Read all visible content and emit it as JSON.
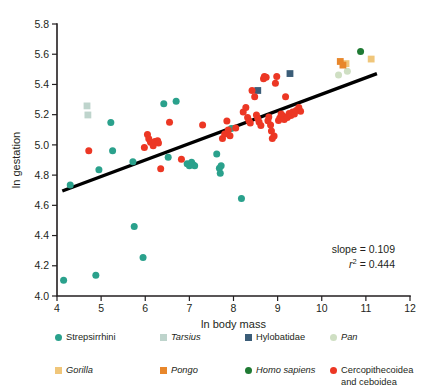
{
  "chart_data": {
    "type": "scatter",
    "title": "",
    "xlabel": "ln body mass",
    "ylabel": "ln gestation",
    "xlim": [
      4,
      12
    ],
    "ylim": [
      4.0,
      5.8
    ],
    "xticks": [
      "4",
      "5",
      "6",
      "7",
      "8",
      "9",
      "10",
      "11",
      "12"
    ],
    "yticks": [
      "4.0",
      "4.2",
      "4.4",
      "4.6",
      "4.8",
      "5.0",
      "5.2",
      "5.4",
      "5.6",
      "5.8"
    ],
    "grid": false,
    "legend_position": "below",
    "annotations": {
      "slope_label": "slope = 0.109",
      "r2_prefix": "r",
      "r2_sup": "2",
      "r2_value": " = 0.444"
    },
    "trendline": {
      "name": "least-squares fit",
      "slope": 0.109,
      "r_squared": 0.444,
      "x0": 4.12,
      "y0": 4.695,
      "x1": 11.25,
      "y1": 5.472,
      "color": "#000000"
    },
    "series": [
      {
        "name": "Strepsirrhini",
        "marker": "circle",
        "color": "#2aa18c",
        "points": [
          [
            4.15,
            4.105
          ],
          [
            4.3,
            4.735
          ],
          [
            4.88,
            4.138
          ],
          [
            4.95,
            4.835
          ],
          [
            5.22,
            5.148
          ],
          [
            5.26,
            4.962
          ],
          [
            5.72,
            4.888
          ],
          [
            5.75,
            4.46
          ],
          [
            5.95,
            4.255
          ],
          [
            6.42,
            5.272
          ],
          [
            6.52,
            4.918
          ],
          [
            6.7,
            5.288
          ],
          [
            6.95,
            4.875
          ],
          [
            7.0,
            4.862
          ],
          [
            7.05,
            4.885
          ],
          [
            7.08,
            4.87
          ],
          [
            7.12,
            4.862
          ],
          [
            7.62,
            4.94
          ],
          [
            7.68,
            4.845
          ],
          [
            7.7,
            4.812
          ],
          [
            7.72,
            4.862
          ],
          [
            7.95,
            5.108
          ],
          [
            8.18,
            4.645
          ]
        ]
      },
      {
        "name": "Tarsius",
        "marker": "square",
        "color": "#bed4cc",
        "points": [
          [
            4.68,
            5.258
          ],
          [
            4.7,
            5.198
          ]
        ]
      },
      {
        "name": "Hylobatidae",
        "marker": "square",
        "color": "#3b5d78",
        "points": [
          [
            8.55,
            5.36
          ],
          [
            9.28,
            5.472
          ]
        ]
      },
      {
        "name": "Pan",
        "marker": "circle",
        "color": "#cfdfc3",
        "points": [
          [
            10.38,
            5.462
          ],
          [
            10.58,
            5.488
          ]
        ]
      },
      {
        "name": "Gorilla",
        "marker": "square",
        "color": "#f0c67a",
        "points": [
          [
            10.55,
            5.538
          ],
          [
            11.12,
            5.568
          ]
        ]
      },
      {
        "name": "Pongo",
        "marker": "square",
        "color": "#e8872b",
        "points": [
          [
            10.42,
            5.552
          ],
          [
            10.48,
            5.528
          ]
        ]
      },
      {
        "name": "Homo sapiens",
        "marker": "circle",
        "color": "#1f7a33",
        "points": [
          [
            10.88,
            5.618
          ]
        ]
      },
      {
        "name": "Cercopithecoidea and ceboidea",
        "marker": "circle",
        "color": "#ec3724",
        "points": [
          [
            4.72,
            4.962
          ],
          [
            5.98,
            4.982
          ],
          [
            6.05,
            5.068
          ],
          [
            6.08,
            5.04
          ],
          [
            6.12,
            5.018
          ],
          [
            6.18,
            4.995
          ],
          [
            6.22,
            5.022
          ],
          [
            6.28,
            5.028
          ],
          [
            6.3,
            5.012
          ],
          [
            6.35,
            4.842
          ],
          [
            6.55,
            5.15
          ],
          [
            6.82,
            4.905
          ],
          [
            7.3,
            5.132
          ],
          [
            7.75,
            5.042
          ],
          [
            7.8,
            5.072
          ],
          [
            7.85,
            5.158
          ],
          [
            7.88,
            5.098
          ],
          [
            7.92,
            5.06
          ],
          [
            8.05,
            5.112
          ],
          [
            8.22,
            5.218
          ],
          [
            8.28,
            5.248
          ],
          [
            8.32,
            5.182
          ],
          [
            8.35,
            5.16
          ],
          [
            8.38,
            5.145
          ],
          [
            8.42,
            5.36
          ],
          [
            8.48,
            5.318
          ],
          [
            8.52,
            5.198
          ],
          [
            8.55,
            5.175
          ],
          [
            8.58,
            5.152
          ],
          [
            8.62,
            5.128
          ],
          [
            8.68,
            5.438
          ],
          [
            8.7,
            5.452
          ],
          [
            8.74,
            5.448
          ],
          [
            8.78,
            5.16
          ],
          [
            8.8,
            5.185
          ],
          [
            8.84,
            5.132
          ],
          [
            8.86,
            5.092
          ],
          [
            8.88,
            5.042
          ],
          [
            8.92,
            5.058
          ],
          [
            8.95,
            5.408
          ],
          [
            8.98,
            5.452
          ],
          [
            9.02,
            5.162
          ],
          [
            9.05,
            5.178
          ],
          [
            9.08,
            5.205
          ],
          [
            9.12,
            5.192
          ],
          [
            9.15,
            5.168
          ],
          [
            9.18,
            5.318
          ],
          [
            9.22,
            5.182
          ],
          [
            9.26,
            5.208
          ],
          [
            9.3,
            5.195
          ],
          [
            9.34,
            5.218
          ],
          [
            9.38,
            5.205
          ],
          [
            9.42,
            5.228
          ],
          [
            9.48,
            5.248
          ],
          [
            9.52,
            5.222
          ]
        ]
      }
    ]
  },
  "legend": {
    "rows": [
      [
        {
          "label": "Strepsirrhini",
          "italic": false,
          "marker": "circle",
          "color": "#2aa18c",
          "name": "legend-item-strepsirrhini"
        },
        {
          "label": "Tarsius",
          "italic": true,
          "marker": "square",
          "color": "#bed4cc",
          "name": "legend-item-tarsius"
        },
        {
          "label": "Hylobatidae",
          "italic": false,
          "marker": "square",
          "color": "#3b5d78",
          "name": "legend-item-hylobatidae"
        },
        {
          "label": "Pan",
          "italic": true,
          "marker": "circle",
          "color": "#cfdfc3",
          "name": "legend-item-pan"
        }
      ],
      [
        {
          "label": "Gorilla",
          "italic": true,
          "marker": "square",
          "color": "#f0c67a",
          "name": "legend-item-gorilla"
        },
        {
          "label": "Pongo",
          "italic": true,
          "marker": "square",
          "color": "#e8872b",
          "name": "legend-item-pongo"
        },
        {
          "label": "Homo sapiens",
          "italic": true,
          "marker": "circle",
          "color": "#1f7a33",
          "name": "legend-item-homo-sapiens"
        },
        {
          "label": "Cercopithecoidea\nand ceboidea",
          "italic": false,
          "marker": "circle",
          "color": "#ec3724",
          "name": "legend-item-cercopithecoidea"
        }
      ]
    ]
  }
}
